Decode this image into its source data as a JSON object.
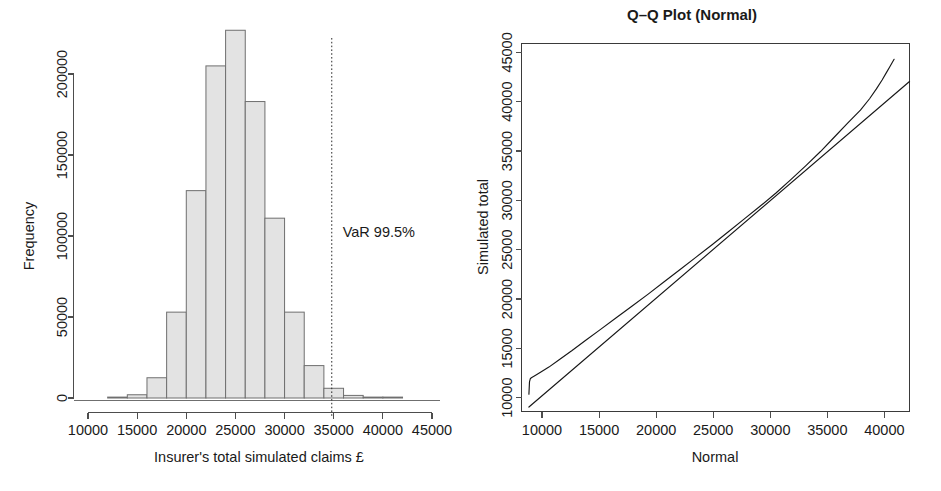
{
  "figure": {
    "width": 941,
    "height": 491,
    "background": "#ffffff",
    "ink_color": "#1a1a1a",
    "bar_fill": "#e3e3e3",
    "bar_stroke": "#6f6f6f"
  },
  "chart_data": [
    {
      "type": "bar",
      "id": "histogram",
      "title": "",
      "xlabel": "Insurer's total simulated claims £",
      "ylabel": "Frequency",
      "xlim": [
        10000,
        45000
      ],
      "ylim": [
        0,
        235000
      ],
      "xticks": [
        10000,
        15000,
        20000,
        25000,
        30000,
        35000,
        40000,
        45000
      ],
      "xticklabels": [
        "10000",
        "15000",
        "20000",
        "25000",
        "30000",
        "35000",
        "40000",
        "45000"
      ],
      "yticks": [
        0,
        50000,
        100000,
        150000,
        200000
      ],
      "yticklabels": [
        "0",
        "50000",
        "100000",
        "150000",
        "200000"
      ],
      "grid": false,
      "legend": "none",
      "bin_width": 2000,
      "bin_edges": [
        12000,
        14000,
        16000,
        18000,
        20000,
        22000,
        24000,
        26000,
        28000,
        30000,
        32000,
        34000,
        36000,
        38000,
        40000,
        42000
      ],
      "values": [
        300,
        2000,
        12500,
        53000,
        128000,
        205000,
        227000,
        183000,
        111000,
        53000,
        20000,
        6000,
        1600,
        400,
        100
      ],
      "annotations": [
        {
          "name": "var-marker",
          "label": "VaR 99.5%",
          "x": 34800,
          "line_style": "dotted",
          "label_x": 35100,
          "label_y": 110000
        }
      ]
    },
    {
      "type": "line",
      "id": "qq-plot",
      "title": "Q–Q Plot (Normal)",
      "xlabel": "Normal",
      "ylabel": "Simulated total",
      "xlim": [
        8200,
        42200
      ],
      "ylim": [
        8600,
        45900
      ],
      "xticks": [
        10000,
        15000,
        20000,
        25000,
        30000,
        35000,
        40000
      ],
      "xticklabels": [
        "10000",
        "15000",
        "20000",
        "25000",
        "30000",
        "35000",
        "40000"
      ],
      "yticks": [
        10000,
        15000,
        20000,
        25000,
        30000,
        35000,
        40000,
        45000
      ],
      "yticklabels": [
        "10000",
        "15000",
        "20000",
        "25000",
        "30000",
        "35000",
        "40000",
        "45000"
      ],
      "grid": false,
      "legend": "none",
      "box": true,
      "series": [
        {
          "name": "sample-quantiles",
          "style": "line",
          "x": [
            8850,
            8900,
            8980,
            9100,
            9400,
            9900,
            10600,
            11500,
            12600,
            13800,
            15100,
            16500,
            17900,
            19300,
            20700,
            22100,
            23500,
            24900,
            26300,
            27700,
            29100,
            30500,
            31800,
            33100,
            34400,
            35600,
            36800,
            37900,
            38700,
            39300,
            39800,
            40200,
            40500,
            40700,
            40850
          ],
          "y": [
            10350,
            11600,
            11950,
            12050,
            12250,
            12600,
            13100,
            13850,
            14750,
            15800,
            16900,
            18100,
            19300,
            20500,
            21750,
            23000,
            24250,
            25500,
            26800,
            28100,
            29400,
            30750,
            32100,
            33500,
            34950,
            36400,
            37850,
            39150,
            40300,
            41300,
            42200,
            43000,
            43600,
            44000,
            44300
          ]
        },
        {
          "name": "reference-line",
          "style": "line",
          "x": [
            8850,
            42200
          ],
          "y": [
            9050,
            42050
          ]
        }
      ]
    }
  ]
}
